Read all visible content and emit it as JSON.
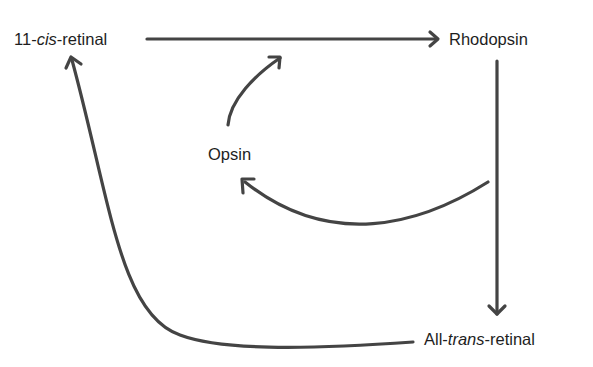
{
  "diagram": {
    "type": "visual-cycle",
    "stroke_color": "#444444",
    "nodes": [
      {
        "id": "cis",
        "prefix": "11-",
        "italic": "cis",
        "suffix": "-retinal"
      },
      {
        "id": "rhodopsin",
        "label": "Rhodopsin"
      },
      {
        "id": "opsin",
        "label": "Opsin"
      },
      {
        "id": "trans",
        "prefix": "All-",
        "italic": "trans",
        "suffix": "-retinal"
      }
    ],
    "edges": [
      {
        "from": "11-cis-retinal",
        "to": "Rhodopsin"
      },
      {
        "from": "Opsin",
        "to": "Rhodopsin"
      },
      {
        "from": "Rhodopsin",
        "to": "Opsin"
      },
      {
        "from": "Rhodopsin",
        "to": "All-trans-retinal"
      },
      {
        "from": "All-trans-retinal",
        "to": "11-cis-retinal"
      }
    ]
  }
}
